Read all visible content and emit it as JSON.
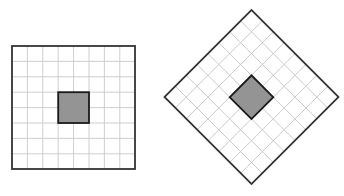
{
  "figure": {
    "title": "",
    "background_color": "#ffffff",
    "width": 344,
    "height": 196,
    "panel_count": 2
  },
  "style": {
    "grid_line_color": "#c8c8c8",
    "grid_line_width": 0.9,
    "border_color": "#333333",
    "border_width": 1.8,
    "shaded_fill_color": "#949494",
    "shaded_border_color": "#1a1a1a",
    "shaded_border_width": 1.8
  },
  "panels": [
    {
      "name": "axis-aligned-grid-square",
      "label": "",
      "rotation_degrees": 0,
      "grid_columns": 8,
      "grid_rows": 8,
      "cell_size_px": 15.4,
      "side_length_px": 123,
      "center_x": 73.5,
      "center_y": 107.5,
      "bounds": {
        "left": 12,
        "top": 46,
        "right": 135,
        "bottom": 169
      },
      "shaded_region": {
        "columns": 2,
        "rows": 2,
        "col_start_index": 3,
        "row_start_index": 3,
        "offset_x_px": 46.2,
        "offset_y_px": 46.2,
        "size_px": 30.8
      }
    },
    {
      "name": "rotated-grid-diamond",
      "label": "",
      "rotation_degrees": 45,
      "grid_columns": 8,
      "grid_rows": 8,
      "cell_size_px": 15.4,
      "side_length_px": 123,
      "center_x": 251.5,
      "center_y": 97,
      "bounds": {
        "left": 164,
        "top": 10,
        "right": 339,
        "bottom": 184
      },
      "vertices": [
        {
          "name": "top",
          "x": 251.5,
          "y": 10
        },
        {
          "name": "right",
          "x": 338.5,
          "y": 97
        },
        {
          "name": "bottom",
          "x": 251.5,
          "y": 184
        },
        {
          "name": "left",
          "x": 164.5,
          "y": 97
        }
      ],
      "shaded_region": {
        "columns": 2,
        "rows": 2,
        "col_start_index": 3,
        "row_start_index": 3,
        "offset_x_px": 46.2,
        "offset_y_px": 46.2,
        "size_px": 30.8
      }
    }
  ]
}
